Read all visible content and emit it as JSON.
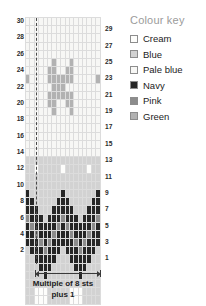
{
  "chart_data": {
    "type": "heatmap",
    "title": "",
    "subtitle": "",
    "xlabel": "Multiple of 8 sts plus 1",
    "ylabel": "",
    "grid": true,
    "legend_position": "right",
    "columns": 17,
    "rows": 30,
    "repeat_note": "Multiple of 8 sts plus 1",
    "repeat_start_column": 2,
    "row_labels_left": [
      30,
      28,
      26,
      24,
      22,
      20,
      18,
      16,
      14,
      12,
      10,
      8,
      6,
      4,
      2
    ],
    "row_labels_right": [
      29,
      27,
      25,
      23,
      21,
      19,
      17,
      15,
      13,
      11,
      9,
      7,
      5,
      3,
      1
    ],
    "color_map": {
      "C": "#fdfdfb",
      "B": "#d2d2d2",
      "P": "#f7f7f5",
      "N": "#262626",
      "K": "#8c8c8c",
      "G": "#b2b2b2"
    },
    "color_names": {
      "C": "Cream",
      "B": "Blue",
      "P": "Pale blue",
      "N": "Navy",
      "K": "Pink",
      "G": "Green"
    },
    "cells": [
      "PPPPPPPPPPPPPPPPP",
      "PPPPPPPPPPPPPPPPP",
      "PPPPPPPPPPPPPPPPP",
      "PPPPPPPPPPPPPPPPP",
      "PPPPPPPPPPPPPPPPP",
      "PPPPPPGPPPGPPPPPP",
      "PPPPPGGPPGGPPPPPP",
      "GPPPPGGGGGGPPPPPG",
      "PPPPPPGGGPPPPPPPP",
      "PPPPPGGGGGGPPPPPP",
      "PPPPPGGPPGGPPPPPP",
      "PPPPPPGPPPGPPPPPP",
      "PPPPPPPPPPPPPPPPP",
      "PPPPPPPPPPPPPPPPP",
      "PPPPPPPPPPPPPPPPP",
      "PPPPPPPPPPPPPPPPP",
      "PPPPPPPPPPPPPPPPP",
      "BBBBBBBBBBBBBBBBB",
      "BBCBBBBBCBBBBBCBB",
      "BBBBBBBBBBBBBBBBB",
      "BBBBBBBBBBBBBBBBB",
      "NBBBBBBBNBBBBBBBN",
      "NNBBBBBNNNBBBBBNN",
      "NNNBBBNNNNNBBBNNN",
      "KNNNBNNNKNNNBNNNK",
      "NKNNNNNKNKNNNNNKN",
      "NNKNNNKNNNKNNNKNN",
      "NNNKNKNNNNNKNKNNN",
      "BNNNKNNNBNNNKNNNB",
      "BBNNNNNBBBNNNNNBB",
      "BBBNNNBBBBBNNNBBB",
      "BBBBNBBBBBBBNBBBB",
      "BBBBBBBBBBBBBBBBB",
      "BBCCCBBBBBCCCBBBB",
      "BBCCCBBBBBCCCBBBB"
    ]
  },
  "legend": {
    "title": "Colour key",
    "items": [
      {
        "label": "Cream",
        "key": "C"
      },
      {
        "label": "Blue",
        "key": "B"
      },
      {
        "label": "Pale blue",
        "key": "P"
      },
      {
        "label": "Navy",
        "key": "N"
      },
      {
        "label": "Pink",
        "key": "K"
      },
      {
        "label": "Green",
        "key": "G"
      }
    ]
  },
  "caption": {
    "line1": "Multiple of 8 sts",
    "line2": "plus 1"
  }
}
